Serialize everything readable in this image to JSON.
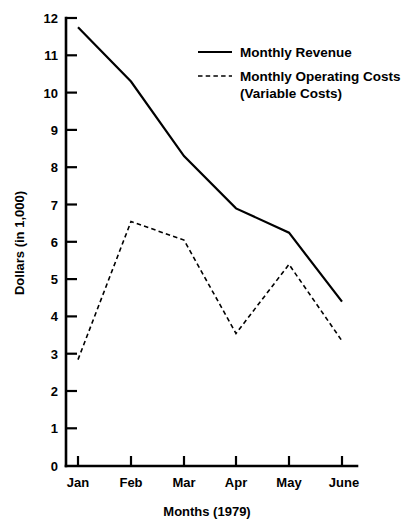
{
  "chart_data": {
    "type": "line",
    "title": "",
    "xlabel": "Months (1979)",
    "ylabel": "Dollars (in 1,000)",
    "categories": [
      "Jan",
      "Feb",
      "Mar",
      "Apr",
      "May",
      "June"
    ],
    "ylim": [
      0,
      12
    ],
    "yticks": [
      0,
      1,
      2,
      3,
      4,
      5,
      6,
      7,
      8,
      9,
      10,
      11,
      12
    ],
    "ytick_labels": [
      "0",
      "1",
      "2",
      "3",
      "4",
      "5",
      "6",
      "7",
      "8",
      "9",
      "10",
      "11",
      "12"
    ],
    "grid": false,
    "legend_position": "upper-right-inside",
    "series": [
      {
        "name": "Monthly Revenue",
        "style": "solid",
        "color": "#000000",
        "values": [
          11.75,
          10.3,
          8.3,
          6.9,
          6.25,
          4.4
        ]
      },
      {
        "name": "Monthly Operating Costs (Variable Costs)",
        "style": "dashed",
        "color": "#000000",
        "values": [
          2.85,
          6.55,
          6.05,
          3.55,
          5.4,
          3.35
        ]
      }
    ]
  },
  "legend": {
    "entries": [
      {
        "label": "Monthly Revenue",
        "label_line2": ""
      },
      {
        "label": "Monthly Operating Costs",
        "label_line2": "(Variable Costs)"
      }
    ]
  },
  "axes": {
    "y_title": "Dollars (in 1,000)",
    "x_title": "Months (1979)"
  }
}
